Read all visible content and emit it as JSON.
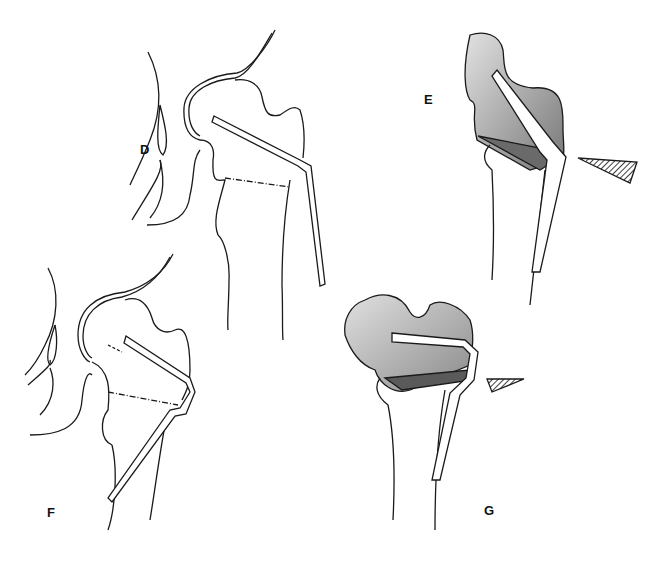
{
  "figure": {
    "panels": [
      {
        "id": "D",
        "label": "D",
        "description": "Proximal femur outline with angled blade plate inserted through femoral neck; dash-dot osteotomy line across intertrochanteric region",
        "label_pos": [
          140,
          155
        ]
      },
      {
        "id": "E",
        "label": "E",
        "description": "Shaded proximal fragment rotated with blade plate; resected wedge shown separately as hatched triangle",
        "label_pos": [
          424,
          98
        ]
      },
      {
        "id": "F",
        "label": "F",
        "description": "Proximal femur outline with blade plate and dash-dot osteotomy line; plate extends down shaft",
        "label_pos": [
          48,
          515
        ]
      },
      {
        "id": "G",
        "label": "G",
        "description": "Shaded proximal fragment with horizontal blade; small hatched wedge removed",
        "label_pos": [
          484,
          511
        ]
      }
    ],
    "colors": {
      "line": "#1a1a1a",
      "shade_light": "#d4d4d4",
      "shade_dark": "#8a8a8a",
      "background": "#ffffff"
    }
  }
}
